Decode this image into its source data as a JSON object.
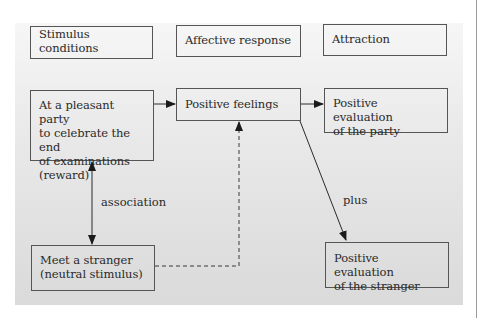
{
  "diagram": {
    "headers": {
      "stimulus": "Stimulus conditions",
      "affective": "Affective response",
      "attraction": "Attraction"
    },
    "nodes": {
      "party": "At a pleasant party\nto celebrate the end\nof examinations\n(reward)",
      "positive_feelings": "Positive feelings",
      "eval_party": "Positive evaluation\nof the party",
      "stranger": "Meet a stranger\n(neutral stimulus)",
      "eval_stranger": "Positive evaluation\nof the stranger"
    },
    "edge_labels": {
      "association": "association",
      "plus": "plus"
    },
    "edges": [
      {
        "from": "party",
        "to": "positive_feelings",
        "style": "solid"
      },
      {
        "from": "positive_feelings",
        "to": "eval_party",
        "style": "solid"
      },
      {
        "from": "positive_feelings",
        "to": "eval_stranger",
        "style": "solid",
        "label": "plus"
      },
      {
        "from": "party",
        "to": "stranger",
        "style": "solid",
        "bidirectional": true,
        "label": "association"
      },
      {
        "from": "stranger",
        "to": "positive_feelings",
        "style": "dashed"
      }
    ],
    "colors": {
      "line": "#2a2a2a",
      "border": "#555555",
      "panel_top": "#f6f6f6",
      "panel_bottom": "#dadada"
    }
  }
}
